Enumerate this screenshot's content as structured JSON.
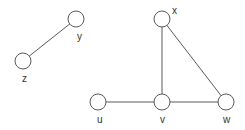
{
  "diagram": {
    "type": "undirected-graph",
    "nodes": [
      {
        "id": "y",
        "label": "y",
        "cx": 76,
        "cy": 19,
        "lx": 77,
        "ly": 40
      },
      {
        "id": "z",
        "label": "z",
        "cx": 23,
        "cy": 61,
        "lx": 22,
        "ly": 82
      },
      {
        "id": "x",
        "label": "x",
        "cx": 162,
        "cy": 19,
        "lx": 172,
        "ly": 14
      },
      {
        "id": "u",
        "label": "u",
        "cx": 98,
        "cy": 102,
        "lx": 97,
        "ly": 123
      },
      {
        "id": "v",
        "label": "v",
        "cx": 162,
        "cy": 102,
        "lx": 160,
        "ly": 123
      },
      {
        "id": "w",
        "label": "w",
        "cx": 226,
        "cy": 102,
        "lx": 223,
        "ly": 123
      }
    ],
    "edges": [
      {
        "from": "y",
        "to": "z"
      },
      {
        "from": "x",
        "to": "v"
      },
      {
        "from": "x",
        "to": "w"
      },
      {
        "from": "u",
        "to": "v"
      },
      {
        "from": "v",
        "to": "w"
      }
    ],
    "node_radius": 8,
    "colors": {
      "stroke": "#5a5a5a",
      "fill": "#ffffff",
      "label": "#333333",
      "background": "#ffffff"
    }
  }
}
